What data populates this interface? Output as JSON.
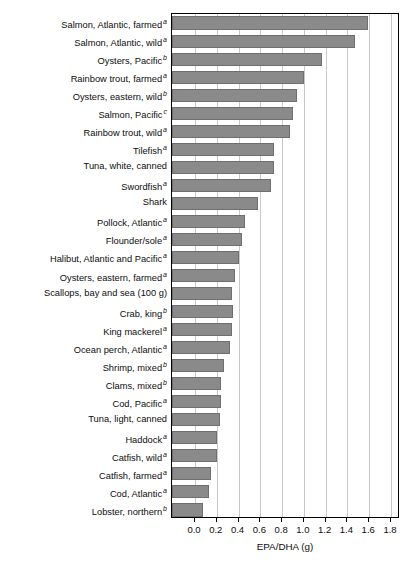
{
  "chart_data": {
    "type": "bar",
    "orientation": "horizontal",
    "title": "",
    "xlabel": "EPA/DHA (g)",
    "ylabel": "",
    "xlim": [
      -0.11,
      1.845
    ],
    "xticks": [
      "0.0",
      "0.2",
      "0.4",
      "0.6",
      "0.8",
      "1.0",
      "1.2",
      "1.4",
      "1.6",
      "1.8"
    ],
    "xtick_values": [
      0.0,
      0.2,
      0.4,
      0.6,
      0.8,
      1.0,
      1.2,
      1.4,
      1.6,
      1.8
    ],
    "grid": true,
    "grid_axis": "x",
    "legend": "none",
    "bar_color": "#8a8a8a",
    "bar_edge_color": "#6f6f6f",
    "axis_color": "#000000",
    "gridline_color": "#c9c9c9",
    "categories": [
      "Salmon, Atlantic, farmed",
      "Salmon, Atlantic, wild",
      "Oysters, Pacific",
      "Rainbow trout, farmed",
      "Oysters, eastern, wild",
      "Salmon, Pacific",
      "Rainbow trout, wild",
      "Tilefish",
      "Tuna, white, canned",
      "Swordfish",
      "Shark",
      "Pollock, Atlantic",
      "Flounder/sole",
      "Halibut, Atlantic and Pacific",
      "Oysters, eastern, farmed",
      "Scallops, bay and sea (100 g)",
      "Crab, king",
      "King mackerel",
      "Ocean perch, Atlantic",
      "Shrimp, mixed",
      "Clams, mixed",
      "Cod, Pacific",
      "Tuna, light, canned",
      "Haddock",
      "Catfish, wild",
      "Catfish, farmed",
      "Cod, Atlantic",
      "Lobster, northern"
    ],
    "footnotes": [
      "a",
      "a",
      "b",
      "a",
      "b",
      "c",
      "a",
      "a",
      "",
      "a",
      "",
      "a",
      "a",
      "a",
      "a",
      "",
      "b",
      "a",
      "a",
      "b",
      "b",
      "a",
      "",
      "a",
      "a",
      "a",
      "a",
      "b"
    ],
    "values": [
      1.59,
      1.47,
      1.17,
      1.0,
      0.94,
      0.9,
      0.87,
      0.73,
      0.73,
      0.7,
      0.58,
      0.46,
      0.43,
      0.4,
      0.37,
      0.34,
      0.35,
      0.34,
      0.32,
      0.27,
      0.24,
      0.24,
      0.23,
      0.2,
      0.2,
      0.15,
      0.13,
      0.07
    ]
  }
}
